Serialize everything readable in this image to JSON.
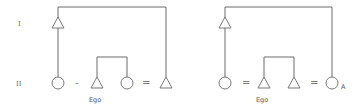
{
  "generation_labels": {
    "first": "I",
    "second": "II"
  },
  "diagrams": [
    {
      "id": "left",
      "ego_label": "Ego",
      "symbols": [
        "circle",
        "triangle",
        "circle",
        "triangle"
      ],
      "relations": [
        "-",
        "="
      ],
      "ascendant": "triangle"
    },
    {
      "id": "right",
      "ego_label": "Ego",
      "symbols": [
        "circle",
        "triangle",
        "triangle",
        "circle"
      ],
      "relations": [
        "=",
        "="
      ],
      "ascendant": "triangle",
      "end_marker": "A"
    }
  ],
  "colors": {
    "line": "#6a6a6a",
    "background": "#ffffff"
  }
}
